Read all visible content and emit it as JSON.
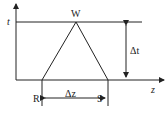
{
  "diagram": {
    "axes": {
      "vertical_label": "t",
      "horizontal_label": "z"
    },
    "points": {
      "apex": "W",
      "left": "R",
      "right": "S"
    },
    "dimensions": {
      "height_label": "Δt",
      "width_label": "Δz"
    },
    "colors": {
      "stroke": "#222222",
      "background": "#ffffff"
    }
  }
}
